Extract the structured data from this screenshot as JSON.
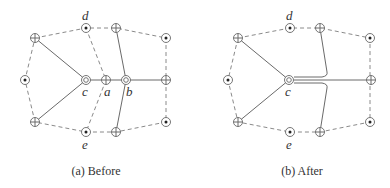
{
  "figure": {
    "panels": [
      {
        "caption": "(a) Before",
        "labels": {
          "d": "d",
          "c": "c",
          "a": "a",
          "b": "b",
          "e": "e"
        }
      },
      {
        "caption": "(b) After",
        "labels": {
          "d": "d",
          "c": "c",
          "e": "e"
        }
      }
    ],
    "node_types": {
      "oplus": "circle-plus-node",
      "odot": "circle-dot-node",
      "ocirc": "double-circle-node"
    },
    "colors": {
      "line": "#6a6a6a",
      "dashed": "#8a8a8a",
      "text": "#333333"
    }
  }
}
